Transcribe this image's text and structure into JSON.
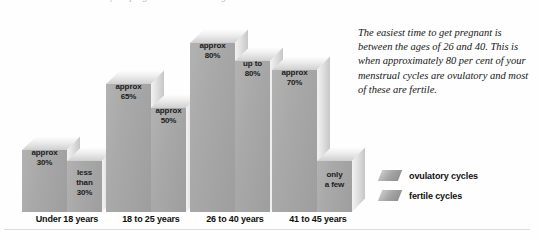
{
  "header": {
    "clipped_note": "your progesterone and oestrogen levels."
  },
  "caption": {
    "text": "The easiest time to get pregnant is between the ages of 26 and 40. This is when approximately 80 per cent of your menstrual cycles are ovulatory and most of these are fertile."
  },
  "legend": {
    "items": [
      {
        "label": "ovulatory cycles",
        "color": "#a5a5a5"
      },
      {
        "label": "fertile cycles",
        "color": "#a5a5a5"
      }
    ]
  },
  "chart_data": {
    "type": "bar",
    "title": "",
    "xlabel": "",
    "ylabel": "",
    "ylim": [
      0,
      100
    ],
    "grid": false,
    "legend_position": "right",
    "categories": [
      "Under 18 years",
      "18 to 25 years",
      "26 to 40 years",
      "41 to 45 years"
    ],
    "series": [
      {
        "name": "ovulatory cycles",
        "values": [
          30,
          65,
          80,
          70
        ],
        "labels": [
          "approx\n30%",
          "approx\n65%",
          "approx\n80%",
          "approx\n70%"
        ]
      },
      {
        "name": "fertile cycles",
        "values": [
          25,
          50,
          80,
          10
        ],
        "labels": [
          "less\nthan\n30%",
          "approx\n50%",
          "up to\n80%",
          "only\na few"
        ]
      }
    ],
    "bar_labels": {
      "g0_ovulatory": "approx\n30%",
      "g0_fertile": "less\nthan\n30%",
      "g1_ovulatory": "approx\n65%",
      "g1_fertile": "approx\n50%",
      "g2_ovulatory": "approx\n80%",
      "g2_fertile": "up to\n80%",
      "g3_ovulatory": "approx\n70%",
      "g3_fertile": "only\na few"
    }
  }
}
